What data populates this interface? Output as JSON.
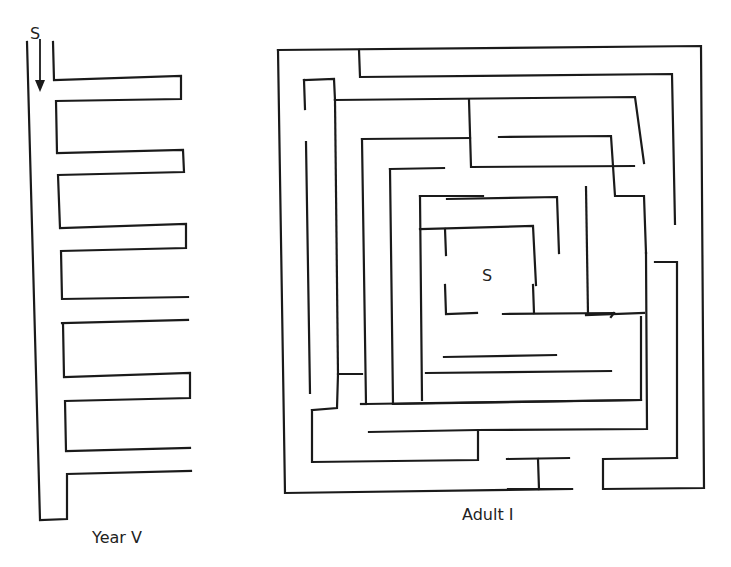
{
  "figures": [
    {
      "id": "year-v",
      "caption": "Year V",
      "start_label": "S",
      "arrow": "down-arrow",
      "walls": [
        [
          [
            27,
            42
          ],
          [
            40,
            520
          ],
          [
            67,
            519
          ],
          [
            67,
            474
          ],
          [
            191,
            471
          ]
        ],
        [
          [
            53,
            42
          ],
          [
            54,
            80
          ],
          [
            181,
            76
          ],
          [
            181,
            99
          ],
          [
            56,
            101
          ],
          [
            57,
            153
          ],
          [
            183,
            150
          ],
          [
            184,
            172
          ],
          [
            58,
            175
          ],
          [
            60,
            228
          ],
          [
            186,
            224
          ],
          [
            186,
            248
          ],
          [
            61,
            251
          ],
          [
            62,
            299
          ],
          [
            188,
            297
          ]
        ],
        [
          [
            62,
            323
          ],
          [
            188,
            320
          ]
        ],
        [
          [
            63,
            323
          ],
          [
            64,
            377
          ],
          [
            190,
            373
          ],
          [
            190,
            398
          ],
          [
            65,
            401
          ],
          [
            66,
            451
          ],
          [
            190,
            448
          ]
        ]
      ]
    },
    {
      "id": "adult-i",
      "caption": "Adult I",
      "start_label": "S",
      "walls": [
        [
          [
            278,
            50
          ],
          [
            701,
            46
          ],
          [
            704,
            488
          ],
          [
            603,
            489
          ],
          [
            603,
            459
          ],
          [
            677,
            458
          ]
        ],
        [
          [
            278,
            50
          ],
          [
            285,
            493
          ],
          [
            572,
            489
          ]
        ],
        [
          [
            359,
            50
          ],
          [
            360,
            77
          ],
          [
            672,
            74
          ],
          [
            675,
            224
          ]
        ],
        [
          [
            304,
            80
          ],
          [
            334,
            79
          ],
          [
            335,
            100
          ]
        ],
        [
          [
            304,
            80
          ],
          [
            305,
            109
          ]
        ],
        [
          [
            306,
            142
          ],
          [
            310,
            393
          ]
        ],
        [
          [
            335,
            100
          ],
          [
            635,
            97
          ],
          [
            644,
            163
          ]
        ],
        [
          [
            335,
            100
          ],
          [
            338,
            374
          ]
        ],
        [
          [
            469,
            100
          ],
          [
            471,
            167
          ],
          [
            634,
            166
          ]
        ],
        [
          [
            499,
            137
          ],
          [
            611,
            136
          ],
          [
            615,
            196
          ],
          [
            644,
            196
          ],
          [
            646,
            253
          ]
        ],
        [
          [
            362,
            139
          ],
          [
            470,
            138
          ]
        ],
        [
          [
            362,
            139
          ],
          [
            366,
            404
          ],
          [
            641,
            400
          ],
          [
            641,
            317
          ]
        ],
        [
          [
            390,
            169
          ],
          [
            444,
            168
          ]
        ],
        [
          [
            390,
            169
          ],
          [
            393,
            404
          ]
        ],
        [
          [
            420,
            196
          ],
          [
            483,
            196
          ]
        ],
        [
          [
            420,
            196
          ],
          [
            422,
            400
          ]
        ],
        [
          [
            447,
            199
          ],
          [
            557,
            197
          ],
          [
            559,
            253
          ]
        ],
        [
          [
            420,
            229
          ],
          [
            533,
            226
          ],
          [
            536,
            285
          ]
        ],
        [
          [
            445,
            229
          ],
          [
            446,
            255
          ]
        ],
        [
          [
            445,
            285
          ],
          [
            446,
            314
          ],
          [
            477,
            313
          ]
        ],
        [
          [
            503,
            314
          ],
          [
            614,
            313
          ]
        ],
        [
          [
            533,
            285
          ],
          [
            534,
            313
          ]
        ],
        [
          [
            586,
            187
          ],
          [
            588,
            315
          ]
        ],
        [
          [
            586,
            315
          ],
          [
            644,
            313
          ]
        ],
        [
          [
            426,
            373
          ],
          [
            611,
            371
          ]
        ],
        [
          [
            444,
            357
          ],
          [
            556,
            355
          ]
        ],
        [
          [
            312,
            410
          ],
          [
            337,
            408
          ],
          [
            338,
            374
          ],
          [
            362,
            374
          ]
        ],
        [
          [
            312,
            410
          ],
          [
            312,
            462
          ],
          [
            478,
            460
          ],
          [
            478,
            432
          ]
        ],
        [
          [
            366,
            404
          ],
          [
            361,
            404
          ]
        ],
        [
          [
            369,
            432
          ],
          [
            478,
            430
          ],
          [
            647,
            429
          ],
          [
            646,
            253
          ]
        ],
        [
          [
            393,
            404
          ],
          [
            641,
            400
          ]
        ],
        [
          [
            507,
            459
          ],
          [
            569,
            458
          ]
        ],
        [
          [
            538,
            459
          ],
          [
            539,
            489
          ]
        ],
        [
          [
            508,
            489
          ],
          [
            572,
            489
          ]
        ],
        [
          [
            655,
            262
          ],
          [
            677,
            262
          ],
          [
            677,
            458
          ]
        ],
        [
          [
            611,
            317
          ],
          [
            614,
            313
          ]
        ]
      ]
    }
  ]
}
